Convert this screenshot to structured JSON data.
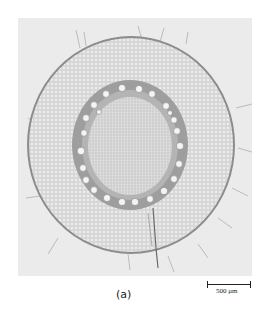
{
  "figure": {
    "caption": "(a)",
    "scale_bar": {
      "label": "500 μm"
    },
    "colors": {
      "background": "#ebebeb",
      "cortex": "#dadada",
      "stele_ring": "#9a9a9a",
      "pith": "#d4d4d4",
      "vessel": "#f4f4f4",
      "epidermis": "#8c8c8c"
    },
    "vessel_count": 24
  }
}
